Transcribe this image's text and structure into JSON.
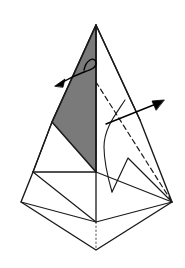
{
  "figure": {
    "title": "Origami folding step diagram",
    "canvas": {
      "width": 185,
      "height": 268
    },
    "colors": {
      "background": "#ffffff",
      "stroke": "#1a1a1a",
      "shaded_face_fill": "#7a7a7a",
      "shaded_face_stroke": "#1a1a1a",
      "dashed_stroke": "#1a1a1a",
      "dotted_stroke": "#555555",
      "arrow_stroke": "#000000",
      "arrow_fill": "#000000",
      "white_face_fill": "#ffffff"
    },
    "stroke_widths": {
      "outline": 1.4,
      "inner": 1.2,
      "dashed": 1.2,
      "dotted": 1.0,
      "arrow": 1.4,
      "curve": 1.1
    },
    "dash_patterns": {
      "hidden_edge": "5,3.5",
      "fold_axis": "1.5,2.5"
    },
    "points": {
      "apex": [
        96,
        25
      ],
      "left_mid": [
        52,
        122
      ],
      "center_waist": [
        96,
        172
      ],
      "left_waist": [
        33,
        172
      ],
      "left_outer": [
        21,
        202
      ],
      "right_outer": [
        172,
        202
      ],
      "bottom_center": [
        96,
        222
      ],
      "bottom_tip": [
        96,
        250
      ],
      "right_upper_edge_mid": [
        140,
        120
      ],
      "flap_peak": [
        128,
        158
      ],
      "dash_start": [
        96,
        82
      ],
      "curve_top": [
        125,
        100
      ],
      "curve_bend": [
        104,
        146
      ],
      "curve_end": [
        112,
        192
      ]
    },
    "shapes": {
      "shaded_face_label": "shaded-triangular-face",
      "white_left_face_label": "white-left-face",
      "base_flaps_label": "base-flap-group"
    },
    "annotations": [
      {
        "name": "rotate-arrow",
        "type": "curved-arrow",
        "direction": "down-left",
        "tail": [
          90,
          58
        ],
        "head": [
          55,
          84
        ],
        "loop": true,
        "meaning": "rotate / fold this flap toward the left"
      },
      {
        "name": "pull-arrow",
        "type": "straight-arrow",
        "direction": "up-right",
        "tail": [
          106,
          124
        ],
        "head": [
          163,
          101
        ],
        "meaning": "pull this layer outward to the right"
      }
    ]
  }
}
